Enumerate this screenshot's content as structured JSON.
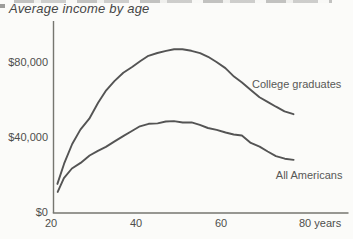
{
  "title": "Average income by age",
  "chart_data": {
    "type": "line",
    "title": "Average income by age",
    "xlabel": "age (years)",
    "ylabel": "average income ($)",
    "xlim": [
      20,
      90
    ],
    "ylim": [
      0,
      100000
    ],
    "grid": false,
    "legend": "inline-labels",
    "axis_color": "#76766f",
    "line_color": "#545454",
    "text_color": "#4e4e4c",
    "x": [
      21.5,
      23,
      25,
      27,
      29,
      31,
      33,
      35,
      37,
      39,
      41,
      43,
      45,
      47,
      49,
      51,
      53,
      55,
      57,
      59,
      61,
      63,
      65,
      67,
      69,
      71,
      73,
      75,
      77
    ],
    "series": [
      {
        "name": "College graduates",
        "values": [
          15000,
          26000,
          36000,
          44000,
          50000,
          58000,
          65000,
          70000,
          74000,
          77500,
          80500,
          83000,
          85000,
          86000,
          86500,
          87000,
          86000,
          84500,
          83000,
          80000,
          76500,
          72500,
          69000,
          65000,
          61500,
          58500,
          56000,
          54000,
          52000
        ]
      },
      {
        "name": "All Americans",
        "values": [
          11000,
          18000,
          23000,
          26500,
          30000,
          32500,
          35000,
          37500,
          40500,
          43500,
          45500,
          47000,
          47500,
          48000,
          48500,
          48000,
          47500,
          46500,
          45000,
          43500,
          42500,
          41500,
          40500,
          37000,
          35000,
          32000,
          30000,
          28500,
          27500
        ]
      }
    ],
    "x_ticks": [
      {
        "value": 20,
        "label": "20"
      },
      {
        "value": 40,
        "label": "40"
      },
      {
        "value": 60,
        "label": "60"
      },
      {
        "value": 80,
        "label": "80 years"
      }
    ],
    "y_ticks": [
      {
        "value": 0,
        "label": "$0"
      },
      {
        "value": 40000,
        "label": "$40,000"
      },
      {
        "value": 80000,
        "label": "$80,000"
      }
    ],
    "annotations": [
      {
        "text": "College graduates",
        "age": 67.3,
        "value": 66000
      },
      {
        "text": "All Americans",
        "age": 72.9,
        "value": 17600
      }
    ]
  }
}
